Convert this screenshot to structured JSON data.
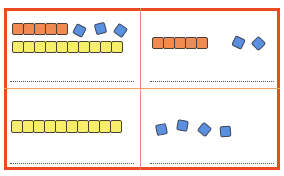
{
  "worksheet": {
    "colors": {
      "border": "#ec4a22",
      "tens_orange": "#f08a52",
      "rod_yellow": "#f7ef6a",
      "ones_blue": "#5b8fe0"
    },
    "panels": [
      {
        "id": "top-left",
        "orange_cubes": 5,
        "yellow_cubes": 10,
        "blue_cubes": 3,
        "answer_line": ""
      },
      {
        "id": "top-right",
        "orange_cubes": 5,
        "yellow_cubes": 0,
        "blue_cubes": 2,
        "answer_line": ""
      },
      {
        "id": "bottom-left",
        "orange_cubes": 0,
        "yellow_cubes": 10,
        "blue_cubes": 0,
        "answer_line": ""
      },
      {
        "id": "bottom-right",
        "orange_cubes": 0,
        "yellow_cubes": 0,
        "blue_cubes": 4,
        "answer_line": ""
      }
    ]
  }
}
